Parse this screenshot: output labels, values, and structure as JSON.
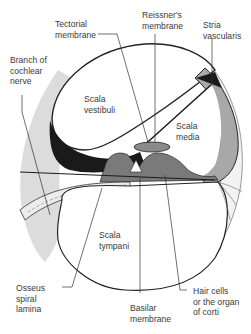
{
  "diagram": {
    "colors": {
      "outline": "#222222",
      "dark_fill": "#1a1a1a",
      "mid_gray": "#9a9a9a",
      "light_gray": "#d8d8d8",
      "label_text": "#3a3a3a"
    },
    "labels": {
      "tectorial_membrane": "Tectorial\nmembrane",
      "reissners_membrane": "Reissner's\nmembrane",
      "stria_vascularis": "Stria\nvascularis",
      "branch_cochlear_nerve": "Branch of\ncochlear\nnerve",
      "scala_vestibuli": "Scala\nvestibuli",
      "scala_media": "Scala\nmedia",
      "scala_tympani": "Scala\ntympani",
      "osseus_spiral_lamina": "Osseus\nspiral\nlamina",
      "basilar_membrane": "Basilar\nmembrane",
      "hair_cells": "Hair cells\nor the organ\nof corti"
    }
  }
}
